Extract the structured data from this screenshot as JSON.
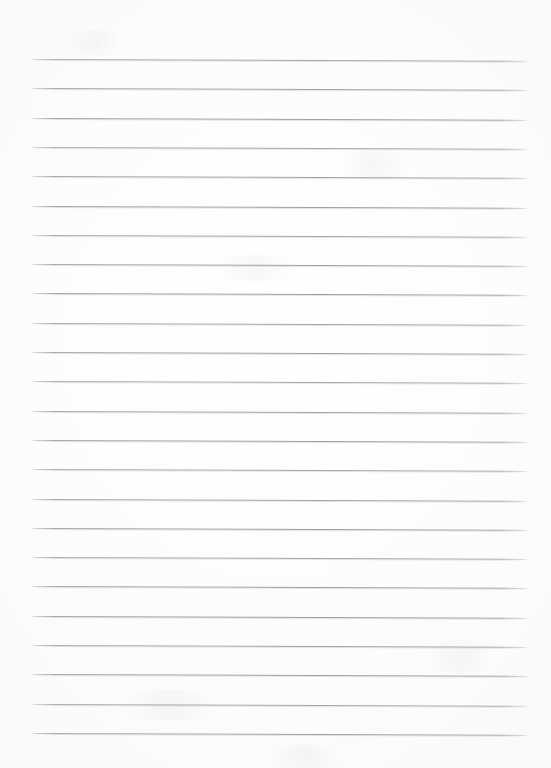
{
  "document": {
    "type": "lined-paper-scan",
    "title": "Blank lined notebook paper",
    "page_width": 551,
    "page_height": 768,
    "background_color": "#fefefe",
    "has_text": false,
    "has_margin_line": false,
    "has_holes": false,
    "body_text": ""
  },
  "rules": {
    "count": 24,
    "color": "#969299",
    "stroke_color": "#96989d",
    "thickness_px": 1,
    "left_x": 30,
    "right_x": 529,
    "first_y": 59,
    "pitch_y": 29.3,
    "last_y": 733,
    "skew_deg": 0.22,
    "y_positions": [
      59,
      88.3,
      117.6,
      146.9,
      176.2,
      205.5,
      234.8,
      264.1,
      293.4,
      322.7,
      352,
      381.3,
      410.6,
      439.9,
      469.2,
      498.5,
      527.8,
      557.1,
      586.4,
      615.7,
      645,
      674.3,
      703.6,
      732.9
    ]
  },
  "smudges": [
    {
      "x": 60,
      "y": 30,
      "w": 70,
      "h": 26
    },
    {
      "x": 330,
      "y": 150,
      "w": 90,
      "h": 30
    },
    {
      "x": 200,
      "y": 255,
      "w": 110,
      "h": 26
    },
    {
      "x": 420,
      "y": 640,
      "w": 80,
      "h": 34
    },
    {
      "x": 110,
      "y": 690,
      "w": 120,
      "h": 30
    },
    {
      "x": 260,
      "y": 745,
      "w": 90,
      "h": 24
    }
  ]
}
